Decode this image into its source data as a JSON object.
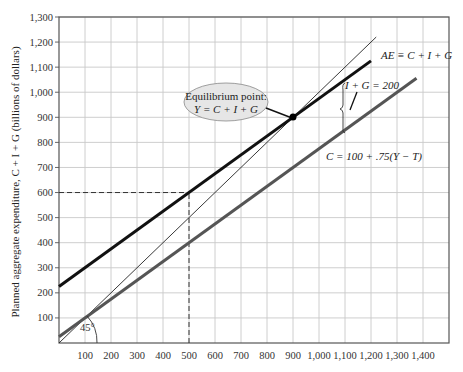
{
  "chart_data": {
    "type": "line",
    "title": "",
    "xlabel": "",
    "ylabel": "Planned aggregate expenditure, C + I + G (billions of dollars)",
    "xlim": [
      0,
      1500
    ],
    "ylim": [
      0,
      1300
    ],
    "grid": true,
    "x_ticks": [
      100,
      200,
      300,
      400,
      500,
      600,
      700,
      800,
      900,
      1000,
      1100,
      1200,
      1300,
      1400
    ],
    "x_tick_labels": [
      "100",
      "200",
      "300",
      "400",
      "500",
      "600",
      "700",
      "800",
      "900",
      "1,000",
      "1,100",
      "1,200",
      "1,300",
      "1,400"
    ],
    "y_ticks": [
      100,
      200,
      300,
      400,
      500,
      600,
      700,
      800,
      900,
      1000,
      1100,
      1200,
      1300
    ],
    "y_tick_labels": [
      "100",
      "200",
      "300",
      "400",
      "500",
      "600",
      "700",
      "800",
      "900",
      "1,000",
      "1,100",
      "1,200",
      "1,300"
    ],
    "series": [
      {
        "name": "45° line (Y = AE)",
        "color": "#222222",
        "width": 0.9,
        "x": [
          0,
          1220
        ],
        "y": [
          0,
          1220
        ]
      },
      {
        "name": "AE = C + I + G",
        "color": "#111111",
        "width": 3,
        "x": [
          0,
          1200
        ],
        "y": [
          225,
          1125
        ]
      },
      {
        "name": "C = 100 + .75(Y − T)",
        "color": "#555555",
        "width": 3,
        "x": [
          0,
          1375
        ],
        "y": [
          25,
          1056
        ]
      }
    ],
    "reference_lines": [
      {
        "type": "dashed",
        "from": [
          0,
          600
        ],
        "to": [
          500,
          600
        ]
      },
      {
        "type": "dashed",
        "from": [
          500,
          0
        ],
        "to": [
          500,
          600
        ]
      }
    ],
    "equilibrium_point": {
      "x": 900,
      "y": 900
    },
    "annotations": {
      "equilibrium_line1": "Equilibrium point:",
      "equilibrium_line2": "Y = C + I + G",
      "ae_label": "AE ≡ C + I + G",
      "ig_label": "I + G = 200",
      "c_label": "C = 100 + .75(Y − T)",
      "angle_label": "45°"
    }
  }
}
